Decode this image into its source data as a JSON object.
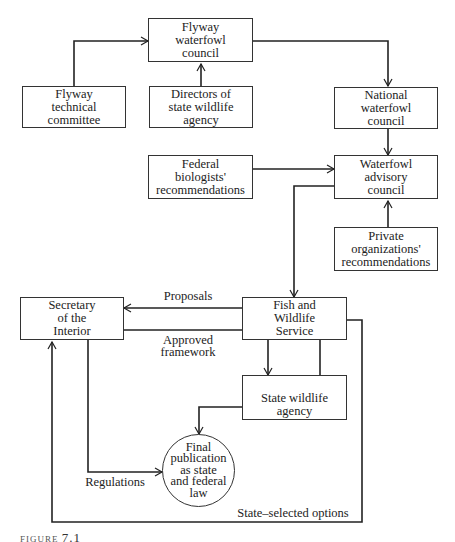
{
  "diagram": {
    "nodes": {
      "flyway_council": "Flyway\nwaterfowl\ncouncil",
      "flyway_technical": "Flyway\ntechnical\ncommittee",
      "state_directors": "Directors of\nstate wildlife\nagency",
      "national_council": "National\nwaterfowl\ncouncil",
      "federal_biologists": "Federal\nbiologists'\nrecommendations",
      "advisory_council": "Waterfowl\nadvisory\ncouncil",
      "private_orgs": "Private\norganizations'\nrecommendations",
      "secretary": "Secretary\nof the\nInterior",
      "fws": "Fish and\nWildlife\nService",
      "state_agency": "State wildlife\nagency",
      "final_publication": "Final\npublication\nas state\nand federal\nlaw"
    },
    "edge_labels": {
      "proposals": "Proposals",
      "approved_framework": "Approved\nframework",
      "regulations": "Regulations",
      "state_selected": "State–selected options"
    },
    "caption": {
      "prefix": "FIGURE",
      "number": "7.1"
    }
  }
}
